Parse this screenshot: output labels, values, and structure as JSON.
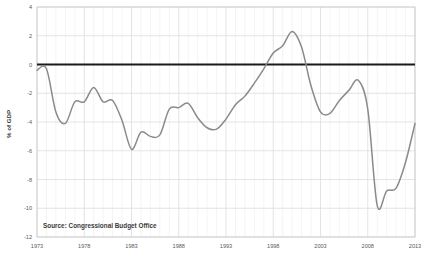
{
  "chart_data": {
    "type": "line",
    "title": "",
    "xlabel": "",
    "ylabel": "% of GDP",
    "xlim": [
      1973,
      2013
    ],
    "ylim": [
      -12,
      4
    ],
    "ytick_labels": [
      "4",
      "2",
      "0",
      "-2",
      "-4",
      "-6",
      "-8",
      "-10",
      "-12"
    ],
    "ytick_values": [
      4,
      2,
      0,
      -2,
      -4,
      -6,
      -8,
      -10,
      -12
    ],
    "xtick_labels": [
      "1973",
      "1978",
      "1983",
      "1988",
      "1993",
      "1998",
      "2003",
      "2008",
      "2013"
    ],
    "xtick_values": [
      1973,
      1978,
      1983,
      1988,
      1993,
      1998,
      2003,
      2008,
      2013
    ],
    "grid": true,
    "minor_grid_x": true,
    "legend": "none",
    "zero_line": true,
    "zero_line_color": "#1a1a1a",
    "line_color": "#8a8a8a",
    "series": [
      {
        "name": "Federal Surplus or Deficit",
        "x": [
          1973,
          1974,
          1975,
          1976,
          1977,
          1978,
          1979,
          1980,
          1981,
          1982,
          1983,
          1984,
          1985,
          1986,
          1987,
          1988,
          1989,
          1990,
          1991,
          1992,
          1993,
          1994,
          1995,
          1996,
          1997,
          1998,
          1999,
          2000,
          2001,
          2002,
          2003,
          2004,
          2005,
          2006,
          2007,
          2008,
          2009,
          2010,
          2011,
          2012,
          2013
        ],
        "values": [
          -0.4,
          -0.3,
          -3.3,
          -4.1,
          -2.6,
          -2.6,
          -1.6,
          -2.6,
          -2.5,
          -3.9,
          -5.9,
          -4.7,
          -5.0,
          -4.9,
          -3.1,
          -3.0,
          -2.7,
          -3.7,
          -4.4,
          -4.5,
          -3.8,
          -2.8,
          -2.2,
          -1.3,
          -0.3,
          0.8,
          1.3,
          2.3,
          1.2,
          -1.5,
          -3.3,
          -3.4,
          -2.5,
          -1.8,
          -1.1,
          -3.1,
          -9.8,
          -8.8,
          -8.6,
          -6.8,
          -4.1
        ],
        "label_units": "% of GDP"
      }
    ],
    "annotations": [
      {
        "name": "source-note",
        "text": "Source: Congressional  Budget Office"
      }
    ]
  },
  "source": {
    "text": "Source: Congressional  Budget Office"
  },
  "axis": {
    "y_title": "% of GDP"
  },
  "colors": {
    "line": "#8a8a8a",
    "zero_line": "#1a1a1a",
    "grid": "#d9d9d9",
    "minor_grid": "#ececec",
    "plot_border": "#c8c8c8",
    "tick_text": "#5a5a5a",
    "background": "#ffffff"
  }
}
